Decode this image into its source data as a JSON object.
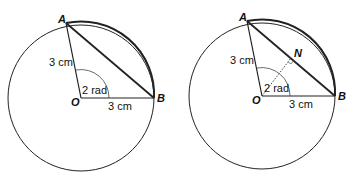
{
  "diagrams": [
    {
      "points": {
        "A": "A",
        "B": "B",
        "O": "O"
      },
      "radius_label_OA": "3 cm",
      "radius_label_OB": "3 cm",
      "angle_label": "2 rad"
    },
    {
      "points": {
        "A": "A",
        "B": "B",
        "O": "O",
        "N": "N"
      },
      "radius_label_OA": "3 cm",
      "radius_label_OB": "3 cm",
      "angle_label": "2 rad"
    }
  ]
}
